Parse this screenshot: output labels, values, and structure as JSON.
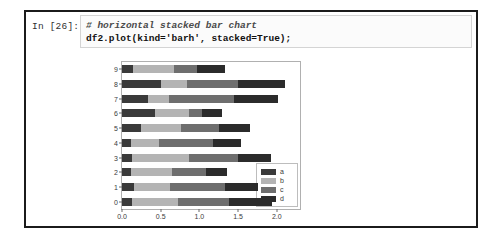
{
  "notebook": {
    "prompt": "In [26]:",
    "code_lines": [
      {
        "text": "# horizontal stacked bar chart",
        "style": "comment"
      },
      {
        "text": "df2.plot(kind='barh', stacked=True);",
        "style": "statement"
      }
    ]
  },
  "chart_data": {
    "type": "bar",
    "orientation": "horizontal",
    "stacked": true,
    "title": "",
    "xlabel": "",
    "ylabel": "",
    "grid": false,
    "legend_position": "lower right",
    "categories": [
      "0",
      "1",
      "2",
      "3",
      "4",
      "5",
      "6",
      "7",
      "8",
      "9"
    ],
    "xticks": [
      "0.0",
      "0.5",
      "1.0",
      "1.5",
      "2.0"
    ],
    "xtick_values": [
      0.0,
      0.5,
      1.0,
      1.5,
      2.0
    ],
    "xlim": [
      0.0,
      2.3
    ],
    "yticks": [
      "0",
      "1",
      "2",
      "3",
      "4",
      "5",
      "6",
      "7",
      "8",
      "9"
    ],
    "series": [
      {
        "name": "a",
        "color": "#3a3a3a",
        "values": [
          0.13,
          0.15,
          0.11,
          0.13,
          0.12,
          0.24,
          0.42,
          0.33,
          0.5,
          0.14
        ]
      },
      {
        "name": "b",
        "color": "#b4b4b4",
        "values": [
          0.6,
          0.47,
          0.54,
          0.73,
          0.36,
          0.52,
          0.45,
          0.28,
          0.34,
          0.53
        ]
      },
      {
        "name": "c",
        "color": "#6e6e6e",
        "values": [
          0.65,
          0.71,
          0.44,
          0.64,
          0.69,
          0.49,
          0.16,
          0.84,
          0.66,
          0.3
        ]
      },
      {
        "name": "d",
        "color": "#2b2b2b",
        "values": [
          0.56,
          0.43,
          0.27,
          0.43,
          0.37,
          0.41,
          0.26,
          0.57,
          0.61,
          0.36
        ]
      }
    ],
    "totals": [
      1.94,
      1.76,
      1.36,
      1.93,
      1.54,
      1.66,
      1.29,
      2.02,
      2.11,
      1.33
    ],
    "legend_entries": [
      "a",
      "b",
      "c",
      "d"
    ]
  }
}
